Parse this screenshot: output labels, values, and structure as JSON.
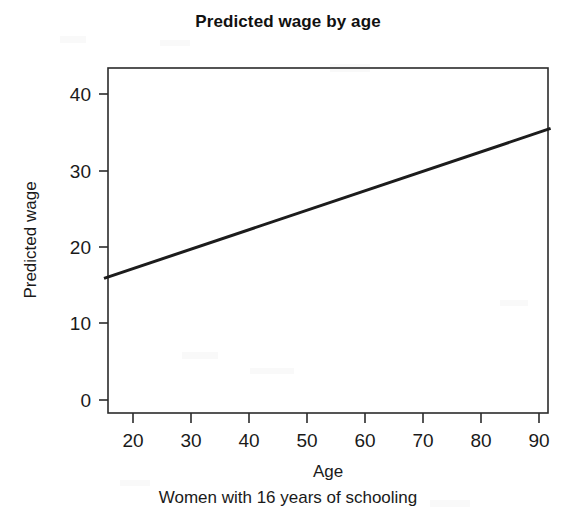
{
  "chart_data": {
    "type": "line",
    "title": "Predicted wage by age",
    "subtitle": "Women with 16 years of schooling",
    "xlabel": "Age",
    "ylabel": "Predicted wage",
    "xlim": [
      15,
      92
    ],
    "ylim": [
      -2,
      44
    ],
    "xticks": [
      20,
      30,
      40,
      50,
      60,
      70,
      80,
      90
    ],
    "xtick_labels": [
      "20",
      "30",
      "40",
      "50",
      "60",
      "70",
      "80",
      "90"
    ],
    "yticks": [
      0,
      10,
      20,
      30,
      40
    ],
    "ytick_labels": [
      "0",
      "10",
      "20",
      "30",
      "40"
    ],
    "grid": false,
    "legend": "none",
    "series": [
      {
        "name": "Predicted wage",
        "color": "#1c1c1c",
        "x": [
          15,
          92
        ],
        "values": [
          15.9,
          35.5
        ]
      }
    ]
  },
  "axes": {
    "box_color": "#2b2b2b"
  }
}
